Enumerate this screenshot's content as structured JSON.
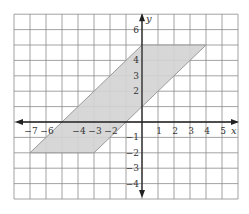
{
  "chart_data": {
    "type": "coordinate-plane",
    "title": "",
    "xlabel": "x",
    "ylabel": "y",
    "xlim": [
      -8,
      6
    ],
    "ylim": [
      -5,
      7
    ],
    "grid": true,
    "x_tick_labels": [
      {
        "value": -7,
        "label": "−7"
      },
      {
        "value": -6,
        "label": "−6"
      },
      {
        "value": -4,
        "label": "−4"
      },
      {
        "value": -3,
        "label": "−3"
      },
      {
        "value": -2,
        "label": "−2"
      },
      {
        "value": 1,
        "label": "1"
      },
      {
        "value": 2,
        "label": "2"
      },
      {
        "value": 3,
        "label": "3"
      },
      {
        "value": 4,
        "label": "4"
      },
      {
        "value": 5,
        "label": "5"
      }
    ],
    "y_tick_labels": [
      {
        "value": 6,
        "label": "6"
      },
      {
        "value": 4,
        "label": "4"
      },
      {
        "value": 3,
        "label": "3"
      },
      {
        "value": 2,
        "label": "2"
      },
      {
        "value": -1,
        "label": "−1"
      },
      {
        "value": -2,
        "label": "−2"
      },
      {
        "value": -3,
        "label": "−3"
      },
      {
        "value": -4,
        "label": "−4"
      }
    ],
    "shapes": [
      {
        "type": "parallelogram",
        "vertices": [
          [
            -7,
            -2
          ],
          [
            -3,
            -2
          ],
          [
            4,
            5
          ],
          [
            0,
            5
          ]
        ],
        "fill": "#d3d3d3",
        "stroke": "#9a9a9a"
      }
    ]
  },
  "colors": {
    "background": "#ffffff",
    "grid": "#8c8c8c",
    "axis": "#222222",
    "shape_fill": "#d3d3d3",
    "shape_stroke": "#9a9a9a",
    "text": "#333333"
  },
  "layout": {
    "origin_px": [
      142,
      122
    ],
    "unit_x_px": 16,
    "unit_y_px": 15.4
  }
}
